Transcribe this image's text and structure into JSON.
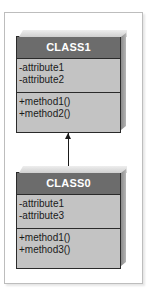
{
  "diagram": {
    "type": "UML class diagram",
    "classes": [
      {
        "id": "class1",
        "name": "CLASS1",
        "attributes": [
          "-attribute1",
          "-attribute2"
        ],
        "methods": [
          "+method1()",
          "+method2()"
        ]
      },
      {
        "id": "class0",
        "name": "CLASS0",
        "attributes": [
          "-attribute1",
          "-attribute3"
        ],
        "methods": [
          "+method1()",
          "+method3()"
        ]
      }
    ],
    "relationships": [
      {
        "from": "CLASS0",
        "to": "CLASS1",
        "type": "association-arrow"
      }
    ]
  },
  "colors": {
    "header": "#6c6c6c",
    "body": "#c3c3c3",
    "border": "#2a2a2a",
    "frame": "#bdbdbd",
    "header_text": "#ffffff"
  }
}
